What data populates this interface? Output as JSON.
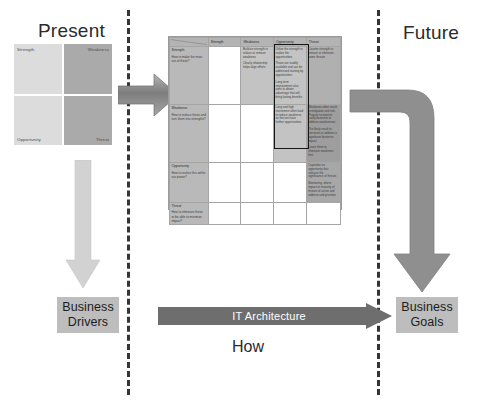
{
  "diagram": {
    "present_label": "Present",
    "future_label": "Future",
    "how_label": "How"
  },
  "swot_quadrants": [
    {
      "key": "strength",
      "label": "Strength"
    },
    {
      "key": "weakness",
      "label": "Weakness"
    },
    {
      "key": "opportunity",
      "label": "Opportunity"
    },
    {
      "key": "threat",
      "label": "Threat"
    }
  ],
  "matrix": {
    "column_headers": [
      "",
      "Strength",
      "Weakness",
      "Opportunity",
      "Threat"
    ],
    "rows": [
      {
        "head_title": "Strength",
        "head_question": "How to make the most out of these?",
        "cells": [
          {
            "fill": "empty",
            "notes": []
          },
          {
            "fill": "fill-b",
            "notes": [
              "Build on strength to reduce or remove weakness",
              "Clearly relationship helps align efforts"
            ]
          },
          {
            "fill": "fill-b",
            "notes": [
              "Utilize the strength to realize the opportunities",
              "Those are readily available and can be addressed starting by opportunities",
              "Long term improvement also aims to obtain advantage that will bring lasting benefits"
            ]
          },
          {
            "fill": "fill-a",
            "notes": [
              "Counter strength to remove or eliminate some threats"
            ]
          }
        ]
      },
      {
        "head_title": "Weakness",
        "head_question": "How to reduce these and turn them into strengths?",
        "cells": [
          {
            "fill": "empty",
            "notes": []
          },
          {
            "fill": "empty",
            "notes": []
          },
          {
            "fill": "fill-b",
            "notes": [
              "Long and high investment often lead to reduce weakness so that we have further opportunities"
            ]
          },
          {
            "fill": "fill-c",
            "notes": [
              "Weakness often result in mitigation and risk. Prepare to monitor costly business or address weaknesses",
              "The likely result to constrain or address a significant business impact",
              "Leave them to eliminate weakness first"
            ]
          }
        ]
      },
      {
        "head_title": "Opportunity",
        "head_question": "How to realize this within our power?",
        "cells": [
          {
            "fill": "empty",
            "notes": []
          },
          {
            "fill": "empty",
            "notes": []
          },
          {
            "fill": "empty",
            "notes": []
          },
          {
            "fill": "fill-d",
            "notes": [
              "Capitalize on opportunity that reduces the significance of threats",
              "Monitoring, where impact or maturity of threats of action and address and prioritize"
            ]
          }
        ]
      },
      {
        "head_title": "Threat",
        "head_question": "How to eliminate these or be able to minimize impact?",
        "cells": [
          {
            "fill": "empty",
            "notes": []
          },
          {
            "fill": "empty",
            "notes": []
          },
          {
            "fill": "empty",
            "notes": []
          },
          {
            "fill": "empty",
            "notes": []
          }
        ]
      }
    ]
  },
  "boxes": {
    "business_drivers": {
      "line1": "Business",
      "line2": "Drivers"
    },
    "business_goals": {
      "line1": "Business",
      "line2": "Goals"
    }
  },
  "it_arrow": {
    "label": "IT Architecture"
  },
  "colors": {
    "swot_light": "#dcdcdc",
    "swot_dark": "#aaaaaa",
    "arrow_gray": "#8f8f8f",
    "arrow_light": "#d2d2d2",
    "box_gray": "#bdbdbd",
    "divider": "#353535",
    "focus_border": "#151515"
  }
}
